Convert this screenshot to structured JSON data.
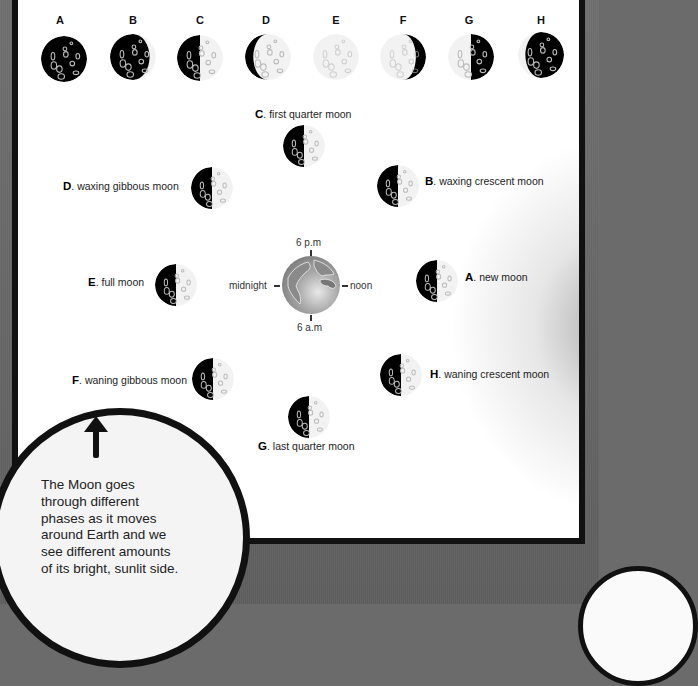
{
  "diagram": {
    "phase_row": [
      {
        "letter": "A",
        "lit_fraction": 0.0,
        "lit_side": "none"
      },
      {
        "letter": "B",
        "lit_fraction": 0.25,
        "lit_side": "right"
      },
      {
        "letter": "C",
        "lit_fraction": 0.5,
        "lit_side": "right"
      },
      {
        "letter": "D",
        "lit_fraction": 0.85,
        "lit_side": "right"
      },
      {
        "letter": "E",
        "lit_fraction": 1.0,
        "lit_side": "all"
      },
      {
        "letter": "F",
        "lit_fraction": 0.8,
        "lit_side": "left"
      },
      {
        "letter": "G",
        "lit_fraction": 0.5,
        "lit_side": "left"
      },
      {
        "letter": "H",
        "lit_fraction": 0.2,
        "lit_side": "left"
      }
    ],
    "orbit": [
      {
        "letter": "C",
        "name": "first quarter moon",
        "position": "top"
      },
      {
        "letter": "B",
        "name": "waxing crescent moon",
        "position": "upper-right"
      },
      {
        "letter": "D",
        "name": "waxing gibbous moon",
        "position": "upper-left"
      },
      {
        "letter": "E",
        "name": "full moon",
        "position": "left"
      },
      {
        "letter": "A",
        "name": "new moon",
        "position": "right"
      },
      {
        "letter": "F",
        "name": "waning gibbous moon",
        "position": "lower-left"
      },
      {
        "letter": "H",
        "name": "waning crescent moon",
        "position": "lower-right"
      },
      {
        "letter": "G",
        "name": "last quarter moon",
        "position": "bottom"
      }
    ],
    "earth": {
      "times": {
        "top": "6 p.m",
        "bottom": "6 a.m",
        "left": "midnight",
        "right": "noon"
      }
    },
    "callout": {
      "text": "The Moon goes through different phases as it moves around Earth and we see different amounts of its bright, sunlit side."
    },
    "colors": {
      "background": "#6b6b6b",
      "panel": "#ffffff",
      "border": "#111111",
      "moon_dark": "#000000",
      "moon_light": "#f2f2f2"
    }
  }
}
